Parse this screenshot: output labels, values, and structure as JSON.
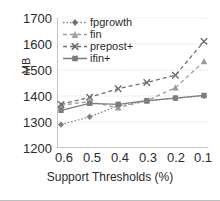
{
  "chart_data": {
    "type": "line",
    "title": "",
    "xlabel": "Support Thresholds (%)",
    "ylabel": "MB",
    "categories": [
      "0.6",
      "0.5",
      "0.4",
      "0.3",
      "0.2",
      "0.1"
    ],
    "x": [
      0.6,
      0.5,
      0.4,
      0.3,
      0.2,
      0.1
    ],
    "ylim": [
      1200,
      1700
    ],
    "yticks": [
      1200,
      1300,
      1400,
      1500,
      1600,
      1700
    ],
    "grid": true,
    "legend_position": "top-left",
    "series": [
      {
        "name": "fpgrowth",
        "marker": "diamond",
        "line": "dotted",
        "color": "#808080",
        "values": [
          1290,
          1320,
          1362,
          1380,
          1392,
          1400
        ]
      },
      {
        "name": "fin",
        "marker": "triangle",
        "line": "dashed",
        "color": "#9a9a9a",
        "values": [
          1365,
          1378,
          1355,
          1382,
          1432,
          1533
        ]
      },
      {
        "name": "prepost+",
        "marker": "x",
        "line": "dashed",
        "color": "#6e6e6e",
        "values": [
          1368,
          1395,
          1428,
          1452,
          1480,
          1610
        ]
      },
      {
        "name": "ifin+",
        "marker": "square",
        "line": "solid",
        "color": "#7d7d7d",
        "values": [
          1345,
          1372,
          1368,
          1382,
          1392,
          1402
        ]
      }
    ]
  },
  "axes": {
    "y_tick_labels": [
      "1700",
      "1600",
      "1500",
      "1400",
      "1300",
      "1200"
    ],
    "x_tick_labels": [
      "0.6",
      "0.5",
      "0.4",
      "0.3",
      "0.2",
      "0.1"
    ],
    "y_axis_title": "MB",
    "x_axis_title": "Support Thresholds (%)"
  },
  "legend": {
    "items": [
      {
        "label": "fpgrowth"
      },
      {
        "label": "fin"
      },
      {
        "label": "prepost+"
      },
      {
        "label": "ifin+"
      }
    ]
  },
  "colors": {
    "axis": "#8c8c8c",
    "grid": "#c9c9c9",
    "text": "#2b2b2b"
  }
}
